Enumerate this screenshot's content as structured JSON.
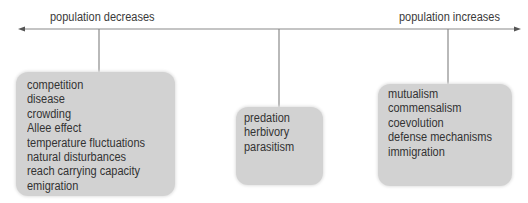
{
  "diagram": {
    "axis": {
      "left_label": "population decreases",
      "right_label": "population increases",
      "line_color": "#8a8a8a"
    },
    "boxes": [
      {
        "id": "decrease",
        "items": [
          "competition",
          "disease",
          "crowding",
          "Allee effect",
          "temperature fluctuations",
          "natural disturbances",
          "reach carrying capacity",
          "emigration"
        ]
      },
      {
        "id": "neutral",
        "items": [
          "predation",
          "herbivory",
          "parasitism"
        ]
      },
      {
        "id": "increase",
        "items": [
          "mutualism",
          "commensalism",
          "coevolution",
          "defense mechanisms",
          "immigration"
        ]
      }
    ],
    "box_color": "#d2d2d2"
  }
}
